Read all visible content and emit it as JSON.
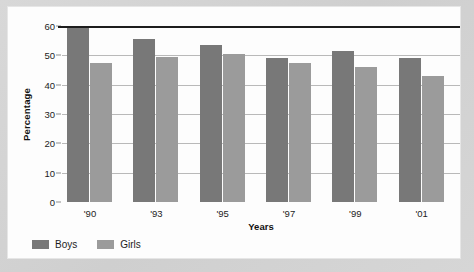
{
  "chart_data": {
    "type": "bar",
    "title": "",
    "xlabel": "Years",
    "ylabel": "Percentage",
    "categories": [
      "'90",
      "'93",
      "'95",
      "'97",
      "'99",
      "'01"
    ],
    "series": [
      {
        "name": "Boys",
        "color": "#787878",
        "values": [
          60,
          55.5,
          53.5,
          49,
          51.5,
          49
        ]
      },
      {
        "name": "Girls",
        "color": "#9b9b9b",
        "values": [
          47.5,
          49.5,
          50.5,
          47.5,
          46,
          43
        ]
      }
    ],
    "ylim": [
      0,
      60
    ],
    "yticks": [
      0,
      10,
      20,
      30,
      40,
      50,
      60
    ],
    "ytick_labels": [
      "0",
      "10",
      "20",
      "30",
      "40",
      "50",
      "60"
    ],
    "grid": true,
    "legend_position": "bottom-left"
  },
  "legend": {
    "items": [
      {
        "label": "Boys",
        "color": "#787878"
      },
      {
        "label": "Girls",
        "color": "#9b9b9b"
      }
    ]
  },
  "colors": {
    "background": "#d2d2d2",
    "card": "#fdfdfd",
    "gridline": "#b9b9b9",
    "axis": "#1d1d1d",
    "text": "#1c1c1c"
  }
}
